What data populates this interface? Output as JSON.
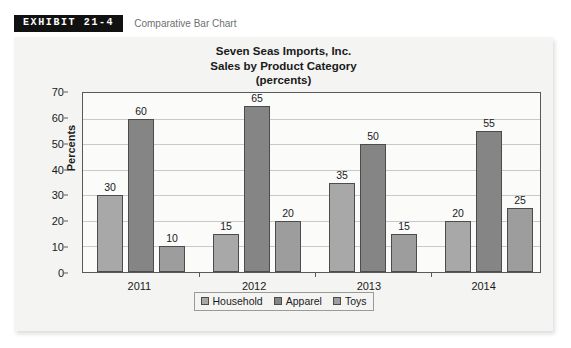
{
  "running_head": "",
  "exhibit": {
    "badge": "EXHIBIT 21-4",
    "caption": "Comparative Bar Chart"
  },
  "chart_data": {
    "type": "bar",
    "title": "Seven Seas Imports, Inc.\nSales by Product Category\n(percents)",
    "title_lines": [
      "Seven Seas Imports, Inc.",
      "Sales by Product Category",
      "(percents)"
    ],
    "xlabel": "",
    "ylabel": "Percents",
    "ylim": [
      0,
      70
    ],
    "yticks": [
      0,
      10,
      20,
      30,
      40,
      50,
      60,
      70
    ],
    "ytick_labels": [
      "0",
      "10",
      "20",
      "30",
      "40",
      "50",
      "60",
      "70"
    ],
    "grid": "horizontal",
    "legend_position": "bottom-center",
    "categories": [
      "2011",
      "2012",
      "2013",
      "2014"
    ],
    "series": [
      {
        "name": "Household",
        "color": "#a8a8a8",
        "values": [
          30,
          15,
          35,
          20
        ]
      },
      {
        "name": "Apparel",
        "color": "#858585",
        "values": [
          60,
          65,
          50,
          55
        ]
      },
      {
        "name": "Toys",
        "color": "#9d9d9d",
        "values": [
          10,
          20,
          15,
          25
        ]
      }
    ],
    "data_labels": [
      [
        "30",
        "60",
        "10"
      ],
      [
        "15",
        "65",
        "20"
      ],
      [
        "35",
        "50",
        "15"
      ],
      [
        "20",
        "55",
        "25"
      ]
    ]
  },
  "colors": {
    "panel_background": "#f4f4f2",
    "plot_background": "#fbfbfa",
    "axis": "#595959",
    "gridline": "#c9c9c9",
    "badge_background": "#111111",
    "badge_text": "#ffffff",
    "caption_text": "#6f6f6f"
  }
}
